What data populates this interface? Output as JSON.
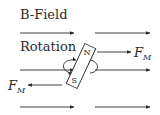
{
  "diagram": {
    "field_label": "B-Field",
    "rotation_label": "Rotation",
    "force_label_main": "F",
    "force_label_sub": "M",
    "north_label": "N",
    "south_label": "S",
    "colors": {
      "line": "#2a2a2a",
      "background": "#ffffff"
    }
  }
}
